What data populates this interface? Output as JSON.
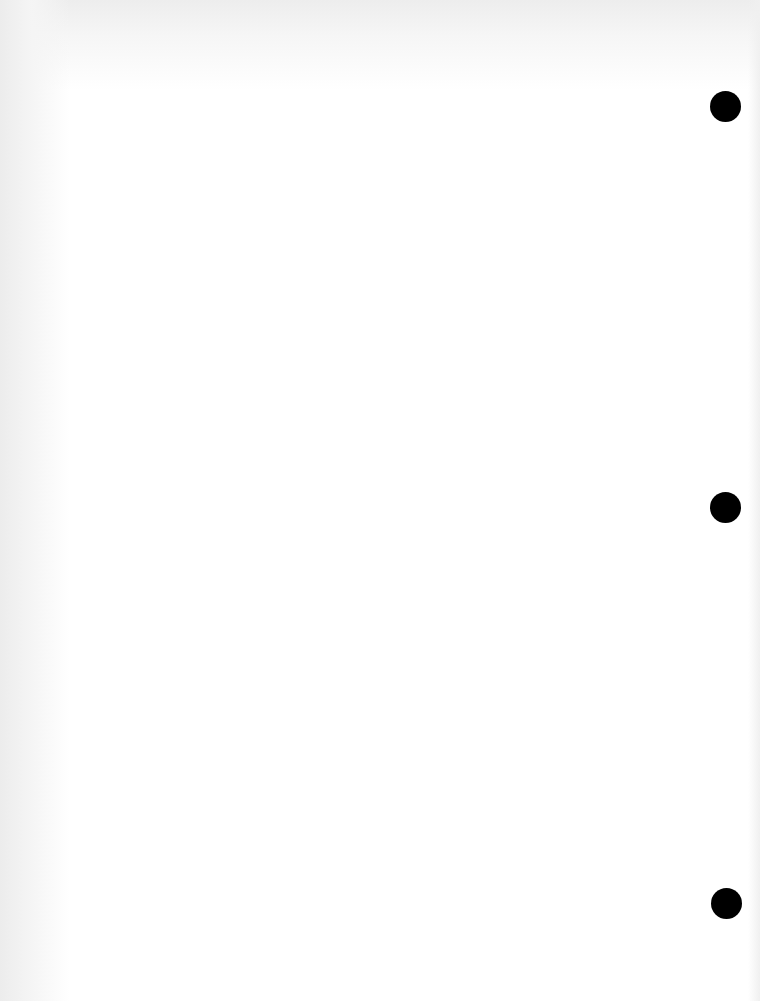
{
  "document": {
    "type": "blank scanned page",
    "text": "",
    "background_color": "#ffffff",
    "punch_holes": [
      {
        "cx": 725,
        "cy": 106,
        "diameter": 31,
        "color": "#000000"
      },
      {
        "cx": 725,
        "cy": 507,
        "diameter": 31,
        "color": "#000000"
      },
      {
        "cx": 726,
        "cy": 903,
        "diameter": 31,
        "color": "#000000"
      }
    ]
  }
}
